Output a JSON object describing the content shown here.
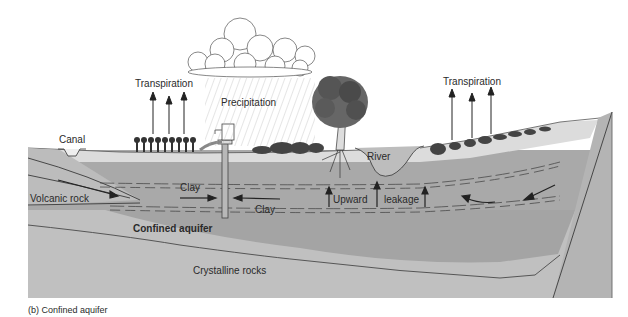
{
  "caption": "(b) Confined aquifer",
  "labels": {
    "transpiration_left": "Transpiration",
    "transpiration_right": "Transpiration",
    "precipitation": "Precipitation",
    "canal": "Canal",
    "river": "River",
    "clay_upper": "Clay",
    "clay_lower": "Clay",
    "volcanic_rock": "Volcanic rock",
    "confined_aquifer": "Confined aquifer",
    "upward": "Upward",
    "leakage": "leakage",
    "crystalline_rocks": "Crystalline rocks"
  },
  "colors": {
    "surface_soil": "#dcdcdc",
    "upper_layer": "#a9a9a9",
    "aquifer": "#a2a2a2",
    "crystalline": "#c0c0c0",
    "volcanic": "#bcbcbc",
    "fault_block": "#b4b4b4",
    "line": "#3a3a3a"
  }
}
